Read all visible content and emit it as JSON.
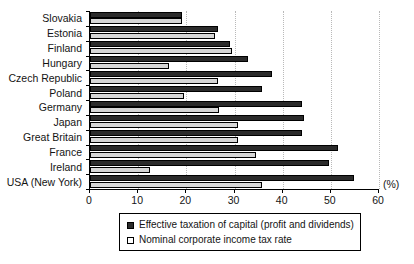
{
  "chart_data": {
    "type": "bar",
    "orientation": "horizontal",
    "title": "",
    "xlabel": "(%)",
    "ylabel": "",
    "xlim": [
      0,
      60
    ],
    "xticks": [
      0,
      10,
      20,
      30,
      40,
      50,
      60
    ],
    "xtick_labels": [
      "0",
      "10",
      "20",
      "30",
      "40",
      "50",
      "60"
    ],
    "grid": "vertical-dotted",
    "legend_position": "bottom-center",
    "categories": [
      "Slovakia",
      "Estonia",
      "Finland",
      "Hungary",
      "Czech Republic",
      "Poland",
      "Germany",
      "Japan",
      "Great Britain",
      "France",
      "Ireland",
      "USA (New York)"
    ],
    "series": [
      {
        "name": "Effective taxation of capital (profit and dividends)",
        "color": "#2b2b2b",
        "values": [
          19.1,
          26.5,
          29.0,
          32.8,
          37.8,
          35.7,
          44.0,
          44.4,
          44.0,
          51.5,
          49.6,
          54.8
        ]
      },
      {
        "name": "Nominal corporate income tax rate",
        "color": "#d6d6d6",
        "values": [
          19.0,
          26.0,
          29.5,
          16.4,
          26.5,
          19.5,
          26.8,
          30.7,
          30.7,
          34.4,
          12.5,
          35.7
        ]
      }
    ]
  },
  "axis": {
    "unit_label": "(%)"
  },
  "legend": {
    "entries": [
      {
        "label": "Effective taxation of capital (profit and dividends)",
        "swatch": "dark"
      },
      {
        "label": "Nominal corporate income tax rate",
        "swatch": "light"
      }
    ]
  }
}
